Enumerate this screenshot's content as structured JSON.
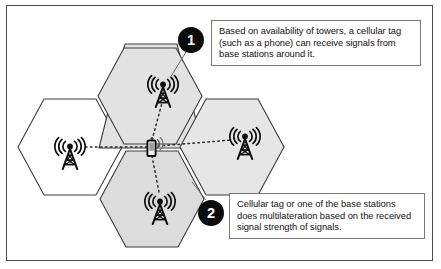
{
  "figure": {
    "background_color": "#ffffff",
    "frame_color": "#4a4a4a"
  },
  "callouts": [
    {
      "number": "1",
      "text": "Based on availability of towers, a cellular tag (such as a phone) can receive signals from base stations around it.",
      "badge_color": "#0b0b0b",
      "badge_text_color": "#ffffff"
    },
    {
      "number": "2",
      "text": "Cellular tag or one of the base stations does multilateration based on the received signal strength of signals.",
      "badge_color": "#0b0b0b",
      "badge_text_color": "#ffffff"
    }
  ],
  "cells": [
    {
      "name": "left-cell",
      "fill": "#ffffff",
      "stroke": "#3c3c3c",
      "cx": 70,
      "cy": 147
    },
    {
      "name": "top-cell",
      "fill": "#e2e2e2",
      "stroke": "#3c3c3c",
      "cx": 150,
      "cy": 96
    },
    {
      "name": "bottom-cell",
      "fill": "#dcdcdc",
      "stroke": "#3c3c3c",
      "cx": 152,
      "cy": 199
    },
    {
      "name": "right-cell",
      "fill": "#e6e6e6",
      "stroke": "#3c3c3c",
      "cx": 232,
      "cy": 147
    }
  ],
  "towers": [
    {
      "name": "tower-left",
      "x": 70,
      "y": 150,
      "label": "base station tower"
    },
    {
      "name": "tower-top",
      "x": 163,
      "y": 88,
      "label": "base station tower"
    },
    {
      "name": "tower-bottom",
      "x": 160,
      "y": 205,
      "label": "base station tower"
    },
    {
      "name": "tower-right",
      "x": 245,
      "y": 140,
      "label": "base station tower"
    }
  ],
  "tag": {
    "name": "cellular-tag-phone",
    "x": 152,
    "y": 148,
    "label": "cellular tag (phone)"
  },
  "signal_links": [
    {
      "from": "cellular-tag-phone",
      "to": "tower-left",
      "style": "dotted"
    },
    {
      "from": "cellular-tag-phone",
      "to": "tower-top",
      "style": "dotted"
    },
    {
      "from": "cellular-tag-phone",
      "to": "tower-bottom",
      "style": "dotted"
    },
    {
      "from": "cellular-tag-phone",
      "to": "tower-right",
      "style": "dotted"
    }
  ],
  "colors": {
    "cell_fill_gray": "#e2e2e2",
    "cell_fill_white": "#ffffff",
    "cell_stroke": "#3c3c3c",
    "signal_line": "#2b2b2b",
    "icon": "#0d0d0d",
    "text": "#141414",
    "callout_border": "#777777"
  }
}
